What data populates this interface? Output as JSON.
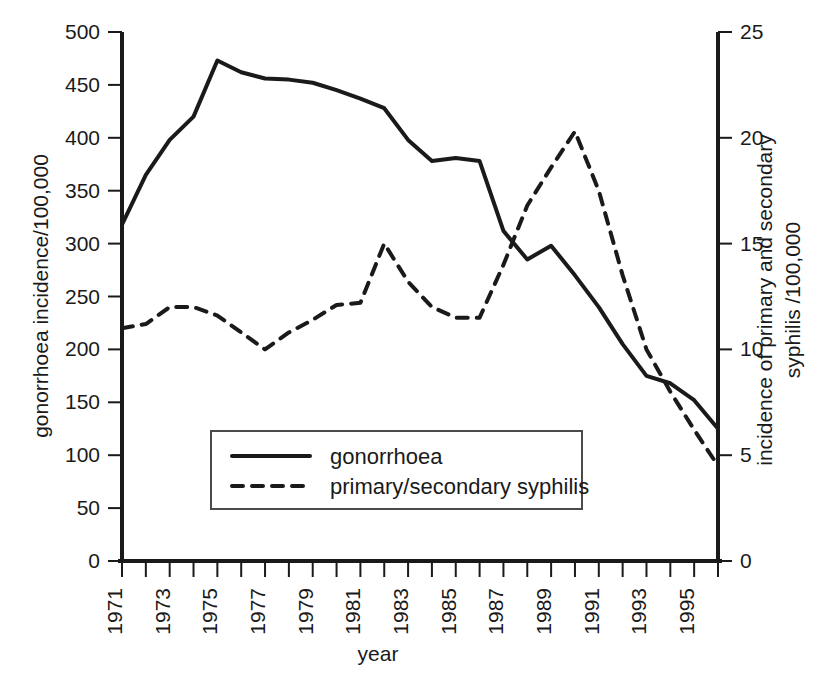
{
  "chart_data": {
    "type": "line",
    "title": "",
    "xlabel": "year",
    "ylabel": "gonorrhoea incidence/100,000",
    "ylabel_right_line1": "incidence of primary and secondary",
    "ylabel_right_line2": "syphilis /100,000",
    "x": [
      1971,
      1972,
      1973,
      1974,
      1975,
      1976,
      1977,
      1978,
      1979,
      1980,
      1981,
      1982,
      1983,
      1984,
      1985,
      1986,
      1987,
      1988,
      1989,
      1990,
      1991,
      1992,
      1993,
      1994,
      1995,
      1996
    ],
    "xtick_labels": [
      "1971",
      "1973",
      "1975",
      "1977",
      "1979",
      "1981",
      "1983",
      "1985",
      "1987",
      "1989",
      "1991",
      "1993",
      "1995"
    ],
    "xtick_years": [
      1971,
      1973,
      1975,
      1977,
      1979,
      1981,
      1983,
      1985,
      1987,
      1989,
      1991,
      1993,
      1995
    ],
    "xlim": [
      1971,
      1996
    ],
    "ylim_left": [
      0,
      500
    ],
    "ylim_right": [
      0,
      25
    ],
    "ytick_left": [
      0,
      50,
      100,
      150,
      200,
      250,
      300,
      350,
      400,
      450,
      500
    ],
    "ytick_left_labels": [
      "0",
      "50",
      "100",
      "150",
      "200",
      "250",
      "300",
      "350",
      "400",
      "450",
      "500"
    ],
    "ytick_right": [
      0,
      5,
      10,
      15,
      20,
      25
    ],
    "ytick_right_labels": [
      "0",
      "5",
      "10",
      "15",
      "20",
      "25"
    ],
    "grid": false,
    "legend_position": "lower-center",
    "series": [
      {
        "name": "gonorrhoea",
        "axis": "left",
        "style": "solid",
        "values": [
          318,
          365,
          398,
          420,
          473,
          462,
          456,
          455,
          452,
          445,
          437,
          428,
          398,
          378,
          381,
          378,
          312,
          285,
          298,
          270,
          240,
          205,
          175,
          168,
          152,
          125
        ]
      },
      {
        "name": "primary/secondary syphilis",
        "axis": "right",
        "style": "dashed",
        "values": [
          11.0,
          11.2,
          12.0,
          12.0,
          11.6,
          10.8,
          10.0,
          10.8,
          11.4,
          12.1,
          12.2,
          15.0,
          13.2,
          12.0,
          11.5,
          11.5,
          14.0,
          16.8,
          18.6,
          20.3,
          17.5,
          13.5,
          10.0,
          8.0,
          6.2,
          4.5
        ]
      }
    ]
  },
  "legend": {
    "entries": [
      {
        "label": "gonorrhoea",
        "style": "solid"
      },
      {
        "label": "primary/secondary syphilis",
        "style": "dashed"
      }
    ]
  },
  "colors": {
    "ink": "#1a1a1a",
    "background": "#ffffff",
    "legend_border": "#4a4a4a"
  }
}
